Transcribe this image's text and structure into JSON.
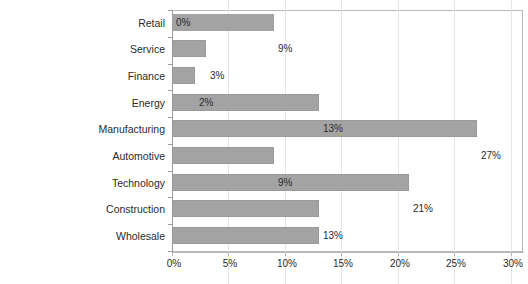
{
  "chart_data": {
    "type": "bar",
    "orientation": "horizontal",
    "title": "",
    "subtitle": "",
    "xlabel": "",
    "ylabel": "",
    "categories": [
      "Retail",
      "Service",
      "Finance",
      "Energy",
      "Manufacturing",
      "Automotive",
      "Technology",
      "Construction",
      "Wholesale"
    ],
    "values": [
      0,
      9,
      3,
      2,
      13,
      27,
      9,
      21,
      13
    ],
    "value_labels": [
      "0%",
      "9%",
      "3%",
      "2%",
      "13%",
      "27%",
      "9%",
      "21%",
      "13%"
    ],
    "xlim": [
      0,
      30
    ],
    "xticks": [
      0,
      5,
      10,
      15,
      20,
      25,
      30
    ],
    "xtick_labels": [
      "0%",
      "5%",
      "10%",
      "15%",
      "20%",
      "25%",
      "30%"
    ],
    "grid": true,
    "grid_axis": "x",
    "legend": false,
    "bar_color": "#a3a3a3",
    "bar_edge_color": "#9a9a9a",
    "gridline_color": "#e4e4e4",
    "axis_color": "#b9b9b9",
    "text_color": "#2b2b2b",
    "background_color": "#ffffff",
    "series": [
      {
        "name": "Share",
        "values": [
          0,
          9,
          3,
          2,
          13,
          27,
          9,
          21,
          13
        ]
      }
    ]
  }
}
